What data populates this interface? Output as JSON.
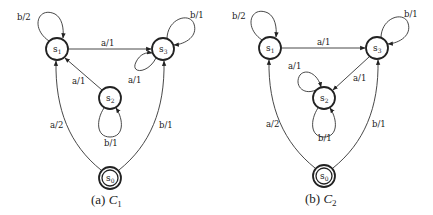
{
  "figures": [
    {
      "id": "C1",
      "caption_prefix": "(a) ",
      "caption_name": "C",
      "caption_sub": "1",
      "states": [
        {
          "name": "s",
          "sub": "0",
          "initial": true
        },
        {
          "name": "s",
          "sub": "1"
        },
        {
          "name": "s",
          "sub": "2"
        },
        {
          "name": "s",
          "sub": "3"
        }
      ],
      "transitions": [
        {
          "from": "s1",
          "to": "s1",
          "label": "b/2"
        },
        {
          "from": "s1",
          "to": "s3",
          "label": "a/1"
        },
        {
          "from": "s3",
          "to": "s3",
          "label": "b/1"
        },
        {
          "from": "s3",
          "to": "s3",
          "label": "a/1"
        },
        {
          "from": "s2",
          "to": "s1",
          "label": "a/1"
        },
        {
          "from": "s2",
          "to": "s2",
          "label": "b/1"
        },
        {
          "from": "s0",
          "to": "s1",
          "label": "a/2"
        },
        {
          "from": "s0",
          "to": "s3",
          "label": "b/1"
        }
      ]
    },
    {
      "id": "C2",
      "caption_prefix": "(b) ",
      "caption_name": "C",
      "caption_sub": "2",
      "states": [
        {
          "name": "s",
          "sub": "0",
          "initial": true
        },
        {
          "name": "s",
          "sub": "1"
        },
        {
          "name": "s",
          "sub": "2"
        },
        {
          "name": "s",
          "sub": "3"
        }
      ],
      "transitions": [
        {
          "from": "s1",
          "to": "s1",
          "label": "b/2"
        },
        {
          "from": "s1",
          "to": "s3",
          "label": "a/1"
        },
        {
          "from": "s3",
          "to": "s3",
          "label": "b/1"
        },
        {
          "from": "s2",
          "to": "s2",
          "label": "a/1"
        },
        {
          "from": "s3",
          "to": "s2",
          "label": "a/1"
        },
        {
          "from": "s2",
          "to": "s2",
          "label": "b/1"
        },
        {
          "from": "s0",
          "to": "s1",
          "label": "a/2"
        },
        {
          "from": "s0",
          "to": "s3",
          "label": "b/1"
        }
      ]
    }
  ]
}
